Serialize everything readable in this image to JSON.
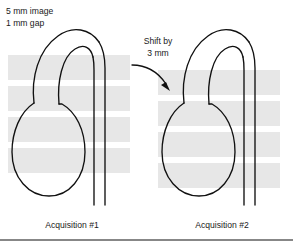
{
  "figure": {
    "background_color": "#ffffff",
    "line_color": "#111111",
    "band_color": "#e7e7e7",
    "slice_legend": {
      "line1": "5 mm image",
      "line2": "1 mm gap"
    },
    "shift_annotation": {
      "line1": "Shift by",
      "line2": "3 mm",
      "arrow_icon": "curved-arrow-down-right-icon"
    },
    "panels": [
      {
        "id": "acquisition-1",
        "caption": "Acquisition #1",
        "band_offset_mm": 0,
        "bands": [
          {
            "y": 55,
            "height": 25
          },
          {
            "y": 86,
            "height": 25
          },
          {
            "y": 117,
            "height": 25
          },
          {
            "y": 148,
            "height": 25
          }
        ],
        "band_x": 8,
        "band_width": 122
      },
      {
        "id": "acquisition-2",
        "caption": "Acquisition #2",
        "band_offset_mm": 3,
        "bands": [
          {
            "y": 70,
            "height": 25
          },
          {
            "y": 101,
            "height": 25
          },
          {
            "y": 132,
            "height": 25
          },
          {
            "y": 163,
            "height": 25
          }
        ],
        "band_x": 158,
        "band_width": 122
      }
    ],
    "slice_thickness_mm": 5,
    "slice_gap_mm": 1,
    "shift_mm": 3,
    "bottom_rule": true
  }
}
